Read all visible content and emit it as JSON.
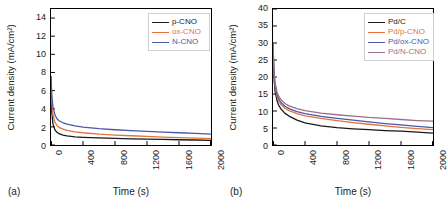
{
  "figure": {
    "panels": [
      {
        "tag": "(a)",
        "xlabel": "Time (s)",
        "ylabel": "Current density (mA/cm²)",
        "xticks": [
          "0",
          "400",
          "800",
          "1200",
          "1600",
          "2000"
        ],
        "yticks": [
          "0",
          "2",
          "4",
          "6",
          "8",
          "10",
          "12",
          "14"
        ],
        "legend": [
          {
            "label": "p-CNO",
            "color": "#1a1a1a"
          },
          {
            "label": "ox-CNO",
            "color": "#E8703A"
          },
          {
            "label": "N-CNO",
            "color": "#4A58A8"
          }
        ]
      },
      {
        "tag": "(b)",
        "xlabel": "Time (s)",
        "ylabel": "Current density (mA/cm²)",
        "xticks": [
          "0",
          "400",
          "800",
          "1200",
          "1600",
          "2000"
        ],
        "yticks": [
          "0",
          "5",
          "10",
          "15",
          "20",
          "25",
          "30",
          "35",
          "40"
        ],
        "legend": [
          {
            "label": "Pd/C",
            "color": "#1a1a1a"
          },
          {
            "label": "Pd/p-CNO",
            "color": "#E8703A"
          },
          {
            "label": "Pd/ox-CNO",
            "color": "#4A58A8"
          },
          {
            "label": "Pd/N-CNO",
            "color": "#9B6F8E"
          }
        ]
      }
    ]
  },
  "chart_data": [
    {
      "type": "line",
      "panel": "(a)",
      "title": "",
      "xlabel": "Time (s)",
      "ylabel": "Current density (mA/cm²)",
      "xlim": [
        0,
        2000
      ],
      "ylim": [
        0,
        15
      ],
      "xticks": [
        0,
        400,
        800,
        1200,
        1600,
        2000
      ],
      "yticks": [
        0,
        2,
        4,
        6,
        8,
        10,
        12,
        14
      ],
      "grid": false,
      "legend_position": "top-right",
      "x": [
        0,
        10,
        25,
        50,
        75,
        100,
        150,
        200,
        300,
        400,
        600,
        800,
        1000,
        1200,
        1400,
        1600,
        1800,
        2000
      ],
      "series": [
        {
          "name": "p-CNO",
          "color": "#1a1a1a",
          "values": [
            7.3,
            3.6,
            2.3,
            1.65,
            1.4,
            1.25,
            1.1,
            1.0,
            0.9,
            0.85,
            0.78,
            0.72,
            0.68,
            0.65,
            0.62,
            0.58,
            0.55,
            0.52
          ]
        },
        {
          "name": "ox-CNO",
          "color": "#E8703A",
          "values": [
            7.5,
            4.6,
            3.3,
            2.5,
            2.15,
            1.95,
            1.75,
            1.62,
            1.45,
            1.35,
            1.2,
            1.1,
            1.02,
            0.95,
            0.88,
            0.82,
            0.76,
            0.7
          ]
        },
        {
          "name": "N-CNO",
          "color": "#4A58A8",
          "values": [
            7.6,
            5.4,
            4.2,
            3.3,
            2.9,
            2.68,
            2.45,
            2.3,
            2.1,
            1.98,
            1.8,
            1.68,
            1.58,
            1.5,
            1.42,
            1.35,
            1.28,
            1.2
          ]
        }
      ]
    },
    {
      "type": "line",
      "panel": "(b)",
      "title": "",
      "xlabel": "Time (s)",
      "ylabel": "Current density (mA/cm²)",
      "xlim": [
        0,
        2000
      ],
      "ylim": [
        0,
        40
      ],
      "xticks": [
        0,
        400,
        800,
        1200,
        1600,
        2000
      ],
      "yticks": [
        0,
        5,
        10,
        15,
        20,
        25,
        30,
        35,
        40
      ],
      "grid": false,
      "legend_position": "top-right",
      "x": [
        0,
        10,
        25,
        50,
        75,
        100,
        150,
        200,
        300,
        400,
        600,
        800,
        1000,
        1200,
        1400,
        1600,
        1800,
        2000
      ],
      "series": [
        {
          "name": "Pd/C",
          "color": "#1a1a1a",
          "values": [
            30.0,
            20.5,
            16.0,
            13.0,
            11.5,
            10.6,
            9.3,
            8.5,
            7.3,
            6.5,
            5.6,
            5.1,
            4.75,
            4.5,
            4.25,
            4.05,
            3.8,
            3.5
          ]
        },
        {
          "name": "Pd/p-CNO",
          "color": "#E8703A",
          "values": [
            30.0,
            21.5,
            17.2,
            14.2,
            12.8,
            11.9,
            10.8,
            10.1,
            9.2,
            8.6,
            7.8,
            7.2,
            6.6,
            6.1,
            5.6,
            5.2,
            4.8,
            4.5
          ]
        },
        {
          "name": "Pd/ox-CNO",
          "color": "#4A58A8",
          "values": [
            30.0,
            22.0,
            17.8,
            14.8,
            13.4,
            12.5,
            11.4,
            10.7,
            9.8,
            9.2,
            8.4,
            7.8,
            7.3,
            6.8,
            6.3,
            5.9,
            5.5,
            5.1
          ]
        },
        {
          "name": "Pd/N-CNO",
          "color": "#9B6F8E",
          "values": [
            30.0,
            22.6,
            18.5,
            15.6,
            14.2,
            13.3,
            12.2,
            11.5,
            10.7,
            10.1,
            9.4,
            8.9,
            8.5,
            8.1,
            7.8,
            7.5,
            7.2,
            7.0
          ]
        }
      ]
    }
  ]
}
